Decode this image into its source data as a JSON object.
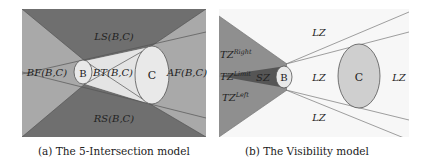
{
  "figure_a": {
    "caption": "(a) The 5-Intersection model",
    "object_b": "B",
    "object_c": "C",
    "regions": {
      "ls": "LS(B,C)",
      "rs": "RS(B,C)",
      "bf": "BF(B,C)",
      "bt": "BT(B,C)",
      "af": "AF(B,C)"
    },
    "colors": {
      "dark": "#6f6f6f",
      "mid": "#a9a9a9",
      "light": "#e4e4e4",
      "object": "#e9e9e9",
      "line": "#555555"
    }
  },
  "figure_b": {
    "caption": "(b) The Visibility model",
    "object_b": "B",
    "object_c": "C",
    "zones": {
      "lz_top": "LZ",
      "lz_mid": "LZ",
      "lz_right": "LZ",
      "lz_bottom": "LZ",
      "tz_right_base": "TZ",
      "tz_right_sup": "Right",
      "tz_limit_base": "TZ",
      "tz_limit_sup": "Limit",
      "tz_left_base": "TZ",
      "tz_left_sup": "Left",
      "sz": "SZ"
    },
    "colors": {
      "tz": "#8f8f8f",
      "sz": "#555555",
      "background": "#f7f7f7",
      "object_b": "#e9e9e9",
      "object_c": "#cfcfcf",
      "line": "#777777"
    }
  }
}
